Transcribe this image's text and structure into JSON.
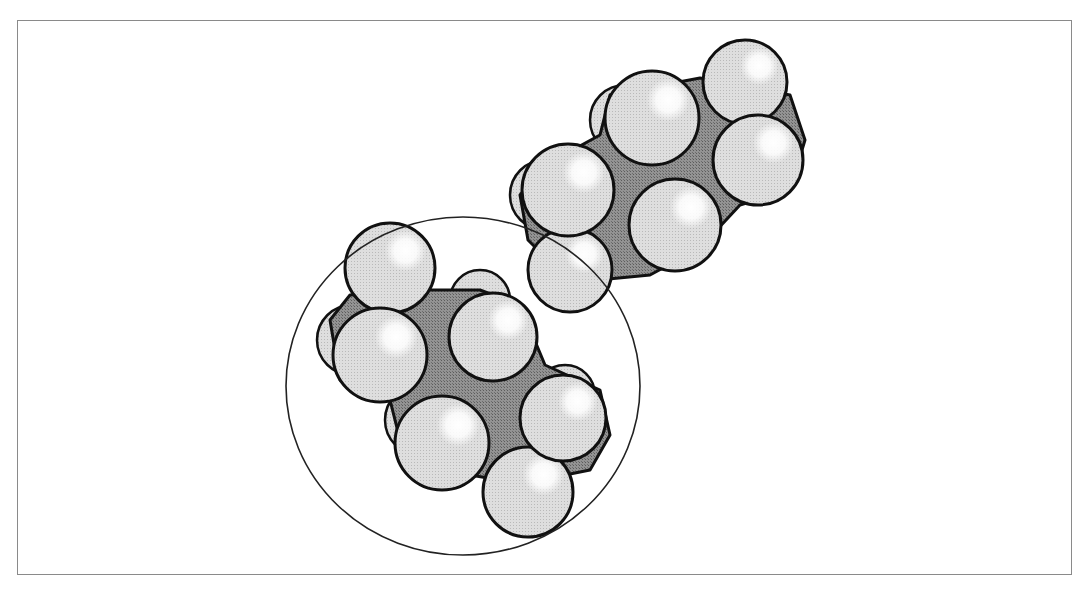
{
  "figure": {
    "colors": {
      "hydrogen_fill": "#dcdcdc",
      "hydrogen_highlight": "#ffffff",
      "carbon_fill": "#8c8c8c",
      "outline": "#111111",
      "frame": "#8a8a8a",
      "enclosing_circle": "#222222"
    },
    "molecules": [
      {
        "name": "upper-butane",
        "carbon_body": "528,240 520,195 545,165 600,135 610,95 700,78 790,95 805,140 790,190 740,205 700,248 650,275 598,280 560,272",
        "hydrogens": [
          {
            "cx": 545,
            "cy": 195,
            "r": 35,
            "back": true
          },
          {
            "cx": 625,
            "cy": 120,
            "r": 35,
            "back": true
          },
          {
            "cx": 745,
            "cy": 82,
            "r": 42,
            "back": false
          },
          {
            "cx": 570,
            "cy": 270,
            "r": 42,
            "back": false
          },
          {
            "cx": 568,
            "cy": 190,
            "r": 46,
            "back": false
          },
          {
            "cx": 652,
            "cy": 118,
            "r": 47,
            "back": false
          },
          {
            "cx": 758,
            "cy": 160,
            "r": 45,
            "back": false
          },
          {
            "cx": 675,
            "cy": 225,
            "r": 46,
            "back": false
          }
        ]
      },
      {
        "name": "lower-butane",
        "carbon_body": "330,320 350,295 420,290 480,290 520,305 545,365 600,390 610,435 590,470 540,480 500,480 440,470 400,440 390,400 340,380",
        "hydrogens": [
          {
            "cx": 352,
            "cy": 340,
            "r": 35,
            "back": true
          },
          {
            "cx": 480,
            "cy": 300,
            "r": 30,
            "back": true
          },
          {
            "cx": 565,
            "cy": 395,
            "r": 30,
            "back": true
          },
          {
            "cx": 420,
            "cy": 420,
            "r": 35,
            "back": true
          },
          {
            "cx": 390,
            "cy": 268,
            "r": 45,
            "back": false
          },
          {
            "cx": 528,
            "cy": 492,
            "r": 45,
            "back": false
          },
          {
            "cx": 380,
            "cy": 355,
            "r": 47,
            "back": false
          },
          {
            "cx": 493,
            "cy": 337,
            "r": 44,
            "back": false
          },
          {
            "cx": 442,
            "cy": 443,
            "r": 47,
            "back": false
          },
          {
            "cx": 563,
            "cy": 418,
            "r": 43,
            "back": false
          }
        ]
      }
    ],
    "enclosing_circle": {
      "cx": 463,
      "cy": 386,
      "rx": 177,
      "ry": 169
    }
  }
}
